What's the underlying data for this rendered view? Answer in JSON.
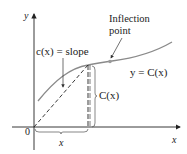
{
  "diagram": {
    "axes": {
      "x_label": "x",
      "y_label": "y",
      "origin_label": "0"
    },
    "curve": {
      "label": "y = C(x)",
      "color": "#8a8a8a"
    },
    "annotations": {
      "slope": "c(x) = slope",
      "inflection_line1": "Inflection",
      "inflection_line2": "point",
      "height": "C(x)",
      "base": "x"
    },
    "colors": {
      "axis": "#222222",
      "curve": "#8a8a8a",
      "inflection_point": "#9a9a9a"
    }
  }
}
